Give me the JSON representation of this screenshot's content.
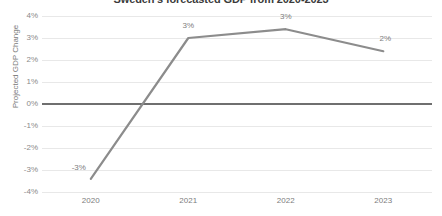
{
  "chart_data": {
    "type": "line",
    "title": "Sweden's forecasted GDP from 2020-2023",
    "xlabel": "",
    "ylabel": "Projected GDP Change",
    "categories": [
      "2020",
      "2021",
      "2022",
      "2023"
    ],
    "values": [
      -3.4,
      3.0,
      3.4,
      2.4
    ],
    "data_labels": [
      "-3%",
      "3%",
      "3%",
      "2%"
    ],
    "ylim": [
      -4,
      4
    ],
    "ytick_labels": [
      "4%",
      "3%",
      "2%",
      "1%",
      "0%",
      "-1%",
      "-2%",
      "-3%",
      "-4%"
    ],
    "ytick_values": [
      4,
      3,
      2,
      1,
      0,
      -1,
      -2,
      -3,
      -4
    ],
    "grid": true,
    "legend": "none",
    "series": [
      {
        "name": "Projected GDP Change",
        "values": [
          -3.4,
          3.0,
          3.4,
          2.4
        ],
        "color": "#8c8c8c"
      }
    ],
    "colors": {
      "line": "#8c8c8c",
      "gridline": "#e8e8e8",
      "zero_axis": "#6f6f6f",
      "tick_text": "#8a8a8a",
      "title_text": "#3b3b3b",
      "background": "#ffffff"
    }
  }
}
